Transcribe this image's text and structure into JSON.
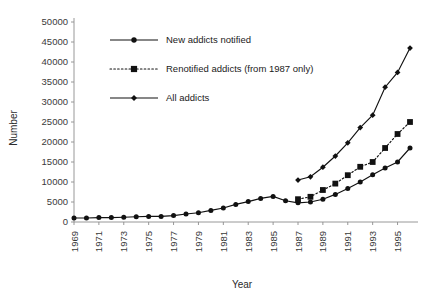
{
  "chart_data": {
    "type": "line",
    "title": "",
    "xlabel": "Year",
    "ylabel": "Number",
    "xlim": [
      1969,
      1996
    ],
    "ylim": [
      0,
      50000
    ],
    "grid": false,
    "legend_position": "top-center",
    "x": [
      1969,
      1970,
      1971,
      1972,
      1973,
      1974,
      1975,
      1976,
      1977,
      1978,
      1979,
      1980,
      1981,
      1982,
      1983,
      1984,
      1985,
      1986,
      1987,
      1988,
      1989,
      1990,
      1991,
      1992,
      1993,
      1994,
      1995,
      1996
    ],
    "xtick_labels": [
      "1969",
      "1971",
      "1973",
      "1975",
      "1977",
      "1979",
      "1981",
      "1983",
      "1985",
      "1987",
      "1989",
      "1991",
      "1993",
      "1995"
    ],
    "ytick_labels": [
      "0",
      "5000",
      "10000",
      "15000",
      "20000",
      "25000",
      "30000",
      "35000",
      "40000",
      "45000",
      "50000"
    ],
    "ytick_values": [
      0,
      5000,
      10000,
      15000,
      20000,
      25000,
      30000,
      35000,
      40000,
      45000,
      50000
    ],
    "series": [
      {
        "name": "New addicts notified",
        "marker": "circle",
        "linestyle": "solid",
        "x": [
          1969,
          1970,
          1971,
          1972,
          1973,
          1974,
          1975,
          1976,
          1977,
          1978,
          1979,
          1980,
          1981,
          1982,
          1983,
          1984,
          1985,
          1986,
          1987,
          1988,
          1989,
          1990,
          1991,
          1992,
          1993,
          1994,
          1995,
          1996
        ],
        "values": [
          1000,
          1000,
          1100,
          1100,
          1200,
          1300,
          1400,
          1400,
          1600,
          2000,
          2300,
          2900,
          3500,
          4400,
          5100,
          5900,
          6400,
          5300,
          4800,
          5000,
          5700,
          6900,
          8400,
          10000,
          11800,
          13500,
          15000,
          18500
        ]
      },
      {
        "name": "Renotified addicts (from 1987 only)",
        "marker": "square",
        "linestyle": "dotted",
        "x": [
          1987,
          1988,
          1989,
          1990,
          1991,
          1992,
          1993,
          1994,
          1995,
          1996
        ],
        "values": [
          5700,
          6300,
          8000,
          9600,
          11700,
          13800,
          15000,
          18500,
          22000,
          25000
        ]
      },
      {
        "name": "All addicts",
        "marker": "diamond",
        "linestyle": "solid",
        "x": [
          1987,
          1988,
          1989,
          1990,
          1991,
          1992,
          1993,
          1994,
          1995,
          1996
        ],
        "values": [
          10500,
          11300,
          13700,
          16500,
          19800,
          23600,
          26700,
          33700,
          37400,
          43500
        ]
      }
    ]
  },
  "legend": {
    "items": [
      {
        "label": "New addicts notified",
        "marker": "circle",
        "linestyle": "solid"
      },
      {
        "label": "Renotified addicts (from 1987 only)",
        "marker": "square",
        "linestyle": "dotted"
      },
      {
        "label": "All addicts",
        "marker": "diamond",
        "linestyle": "solid"
      }
    ]
  },
  "colors": {
    "ink": "#111111",
    "axis": "#8c8c8c",
    "background": "#ffffff"
  }
}
